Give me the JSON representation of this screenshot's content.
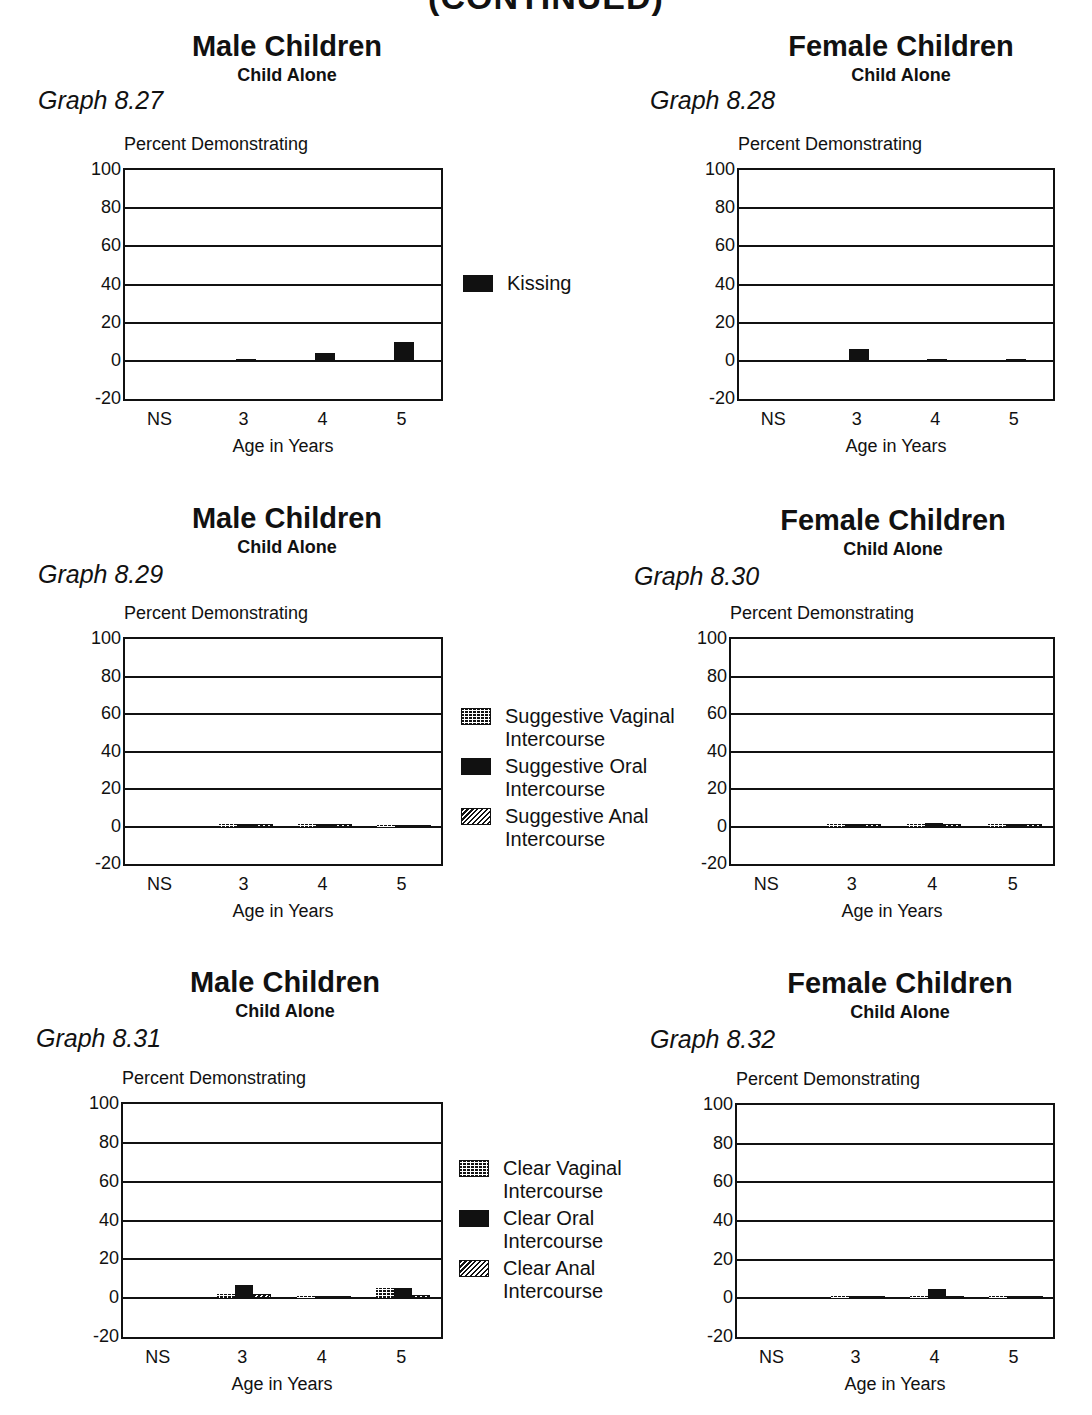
{
  "page": {
    "header_fragment": "(CONTINUED)"
  },
  "panels": [
    {
      "id": "graph-8-27",
      "title": "Male Children",
      "subtitle": "Child Alone",
      "graph_label": "Graph 8.27",
      "ylabel": "Percent Demonstrating",
      "xlabel": "Age in Years",
      "yticks": [
        "100",
        "80",
        "60",
        "40",
        "20",
        "0",
        "-20"
      ],
      "xticks": [
        "NS",
        "3",
        "4",
        "5"
      ]
    },
    {
      "id": "graph-8-28",
      "title": "Female Children",
      "subtitle": "Child Alone",
      "graph_label": "Graph 8.28",
      "ylabel": "Percent Demonstrating",
      "xlabel": "Age in Years",
      "yticks": [
        "100",
        "80",
        "60",
        "40",
        "20",
        "0",
        "-20"
      ],
      "xticks": [
        "NS",
        "3",
        "4",
        "5"
      ]
    },
    {
      "id": "graph-8-29",
      "title": "Male Children",
      "subtitle": "Child Alone",
      "graph_label": "Graph 8.29",
      "ylabel": "Percent Demonstrating",
      "xlabel": "Age in Years",
      "yticks": [
        "100",
        "80",
        "60",
        "40",
        "20",
        "0",
        "-20"
      ],
      "xticks": [
        "NS",
        "3",
        "4",
        "5"
      ]
    },
    {
      "id": "graph-8-30",
      "title": "Female Children",
      "subtitle": "Child Alone",
      "graph_label": "Graph 8.30",
      "ylabel": "Percent Demonstrating",
      "xlabel": "Age in Years",
      "yticks": [
        "100",
        "80",
        "60",
        "40",
        "20",
        "0",
        "-20"
      ],
      "xticks": [
        "NS",
        "3",
        "4",
        "5"
      ]
    },
    {
      "id": "graph-8-31",
      "title": "Male Children",
      "subtitle": "Child Alone",
      "graph_label": "Graph 8.31",
      "ylabel": "Percent Demonstrating",
      "xlabel": "Age in Years",
      "yticks": [
        "100",
        "80",
        "60",
        "40",
        "20",
        "0",
        "-20"
      ],
      "xticks": [
        "NS",
        "3",
        "4",
        "5"
      ]
    },
    {
      "id": "graph-8-32",
      "title": "Female Children",
      "subtitle": "Child Alone",
      "graph_label": "Graph 8.32",
      "ylabel": "Percent Demonstrating",
      "xlabel": "Age in Years",
      "yticks": [
        "100",
        "80",
        "60",
        "40",
        "20",
        "0",
        "-20"
      ],
      "xticks": [
        "NS",
        "3",
        "4",
        "5"
      ]
    }
  ],
  "legends": {
    "row1": [
      {
        "label": "Kissing",
        "pattern": "solid"
      }
    ],
    "row2": [
      {
        "label": "Suggestive Vaginal Intercourse",
        "pattern": "grid"
      },
      {
        "label": "Suggestive Oral Intercourse",
        "pattern": "solid"
      },
      {
        "label": "Suggestive Anal Intercourse",
        "pattern": "hatch"
      }
    ],
    "row3": [
      {
        "label": "Clear Vaginal Intercourse",
        "pattern": "grid"
      },
      {
        "label": "Clear Oral Intercourse",
        "pattern": "solid"
      },
      {
        "label": "Clear Anal Intercourse",
        "pattern": "hatch"
      }
    ]
  },
  "chart_data": [
    {
      "type": "bar",
      "title": "Male Children - Child Alone (Graph 8.27)",
      "xlabel": "Age in Years",
      "ylabel": "Percent Demonstrating",
      "ylim": [
        -20,
        100
      ],
      "yticks": [
        -20,
        0,
        20,
        40,
        60,
        80,
        100
      ],
      "grid": true,
      "legend_position": "right",
      "categories": [
        "NS",
        "3",
        "4",
        "5"
      ],
      "series": [
        {
          "name": "Kissing",
          "values": [
            0,
            1,
            4,
            10
          ]
        }
      ]
    },
    {
      "type": "bar",
      "title": "Female Children - Child Alone (Graph 8.28)",
      "xlabel": "Age in Years",
      "ylabel": "Percent Demonstrating",
      "ylim": [
        -20,
        100
      ],
      "yticks": [
        -20,
        0,
        20,
        40,
        60,
        80,
        100
      ],
      "grid": true,
      "legend_position": "left (shared)",
      "categories": [
        "NS",
        "3",
        "4",
        "5"
      ],
      "series": [
        {
          "name": "Kissing",
          "values": [
            0,
            6,
            1,
            1
          ]
        }
      ]
    },
    {
      "type": "bar",
      "title": "Male Children - Child Alone (Graph 8.29)",
      "xlabel": "Age in Years",
      "ylabel": "Percent Demonstrating",
      "ylim": [
        -20,
        100
      ],
      "yticks": [
        -20,
        0,
        20,
        40,
        60,
        80,
        100
      ],
      "grid": true,
      "legend_position": "right",
      "categories": [
        "NS",
        "3",
        "4",
        "5"
      ],
      "series": [
        {
          "name": "Suggestive Vaginal Intercourse",
          "values": [
            0,
            1.5,
            1.5,
            1
          ]
        },
        {
          "name": "Suggestive Oral Intercourse",
          "values": [
            0,
            1.5,
            1.5,
            1
          ]
        },
        {
          "name": "Suggestive Anal Intercourse",
          "values": [
            0,
            1.5,
            1.5,
            1
          ]
        }
      ]
    },
    {
      "type": "bar",
      "title": "Female Children - Child Alone (Graph 8.30)",
      "xlabel": "Age in Years",
      "ylabel": "Percent Demonstrating",
      "ylim": [
        -20,
        100
      ],
      "yticks": [
        -20,
        0,
        20,
        40,
        60,
        80,
        100
      ],
      "grid": true,
      "legend_position": "left (shared)",
      "categories": [
        "NS",
        "3",
        "4",
        "5"
      ],
      "series": [
        {
          "name": "Suggestive Vaginal Intercourse",
          "values": [
            0,
            1.5,
            1.5,
            1.5
          ]
        },
        {
          "name": "Suggestive Oral Intercourse",
          "values": [
            0,
            1.5,
            2,
            1.5
          ]
        },
        {
          "name": "Suggestive Anal Intercourse",
          "values": [
            0,
            1.5,
            1.5,
            1.5
          ]
        }
      ]
    },
    {
      "type": "bar",
      "title": "Male Children - Child Alone (Graph 8.31)",
      "xlabel": "Age in Years",
      "ylabel": "Percent Demonstrating",
      "ylim": [
        -20,
        100
      ],
      "yticks": [
        -20,
        0,
        20,
        40,
        60,
        80,
        100
      ],
      "grid": true,
      "legend_position": "right",
      "categories": [
        "NS",
        "3",
        "4",
        "5"
      ],
      "series": [
        {
          "name": "Clear Vaginal Intercourse",
          "values": [
            0,
            2,
            1,
            5
          ]
        },
        {
          "name": "Clear Oral Intercourse",
          "values": [
            0,
            7,
            1,
            5
          ]
        },
        {
          "name": "Clear Anal Intercourse",
          "values": [
            0,
            2,
            1,
            1.5
          ]
        }
      ]
    },
    {
      "type": "bar",
      "title": "Female Children - Child Alone (Graph 8.32)",
      "xlabel": "Age in Years",
      "ylabel": "Percent Demonstrating",
      "ylim": [
        -20,
        100
      ],
      "yticks": [
        -20,
        0,
        20,
        40,
        60,
        80,
        100
      ],
      "grid": true,
      "legend_position": "left (shared)",
      "categories": [
        "NS",
        "3",
        "4",
        "5"
      ],
      "series": [
        {
          "name": "Clear Vaginal Intercourse",
          "values": [
            0,
            1,
            1,
            1
          ]
        },
        {
          "name": "Clear Oral Intercourse",
          "values": [
            0,
            1,
            5,
            1
          ]
        },
        {
          "name": "Clear Anal Intercourse",
          "values": [
            0,
            1,
            1,
            1
          ]
        }
      ]
    }
  ]
}
